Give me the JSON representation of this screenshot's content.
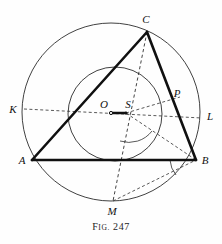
{
  "figure": {
    "caption_prefix_first": "F",
    "caption_prefix_rest": "IG.",
    "caption_number": "247",
    "caption_full": "FIG. 247"
  },
  "colors": {
    "ink": "#111111",
    "thin_ink": "#3a3a3a",
    "paper": "#fefefe"
  },
  "geometry": {
    "circumcircle": {
      "cx": 111,
      "cy": 112,
      "r": 89,
      "label": "circumcircle"
    },
    "incircle": {
      "cx": 115,
      "cy": 114,
      "r": 47,
      "label": "incircle"
    },
    "points": {
      "A": {
        "x": 32,
        "y": 160,
        "label": "A",
        "label_x": 22,
        "label_y": 164
      },
      "B": {
        "x": 196,
        "y": 160,
        "label": "B",
        "label_x": 203,
        "label_y": 164
      },
      "C": {
        "x": 147,
        "y": 32,
        "label": "C",
        "label_x": 145,
        "label_y": 22
      },
      "K": {
        "x": 27,
        "y": 110,
        "label": "K",
        "label_x": 12,
        "label_y": 113
      },
      "L": {
        "x": 199,
        "y": 117,
        "label": "L",
        "label_x": 205,
        "label_y": 120
      },
      "M": {
        "x": 113,
        "y": 201,
        "label": "M",
        "label_x": 109,
        "label_y": 214
      },
      "O": {
        "x": 111,
        "y": 112,
        "label": "O",
        "label_x": 101,
        "label_y": 110
      },
      "P": {
        "x": 173,
        "y": 101,
        "label": "P",
        "label_x": 174,
        "label_y": 98
      },
      "S": {
        "x": 126,
        "y": 113,
        "label": "S",
        "label_x": 124,
        "label_y": 110
      }
    },
    "solid_segments": [
      {
        "name": "side-AB",
        "from": "A",
        "to": "B"
      },
      {
        "name": "side-BC",
        "from": "B",
        "to": "C"
      },
      {
        "name": "side-CA",
        "from": "C",
        "to": "A"
      },
      {
        "name": "segment-OS",
        "from": "O",
        "to": "S"
      }
    ],
    "dashed_segments": [
      {
        "name": "line-KL",
        "from": "K",
        "to": "L"
      },
      {
        "name": "line-CM",
        "from": "C",
        "to": "M"
      },
      {
        "name": "segment-SP",
        "from": "S",
        "to": "P"
      },
      {
        "name": "segment-SB",
        "from": "S",
        "to": "B"
      },
      {
        "name": "segment-MB",
        "from": "M",
        "to": "B"
      }
    ],
    "angle_arcs": [
      {
        "name": "angle-arc-at-S",
        "vertex": "S",
        "radius": 28
      },
      {
        "name": "angle-arc-at-B",
        "vertex": "B",
        "radius": 26
      }
    ]
  }
}
